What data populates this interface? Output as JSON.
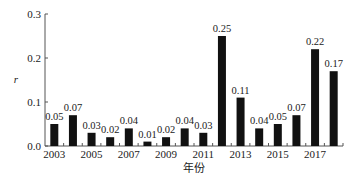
{
  "chart_data": {
    "type": "bar",
    "title": "",
    "xlabel": "年份",
    "ylabel": "r",
    "ylim": [
      0,
      0.3
    ],
    "yticks": [
      "0.0",
      "0.1",
      "0.2",
      "0.3"
    ],
    "xtick_labels": [
      "2003",
      "2005",
      "2007",
      "2009",
      "2011",
      "2013",
      "2015",
      "2017"
    ],
    "grid": false,
    "legend": null,
    "categories": [
      "2003",
      "2004",
      "2005",
      "2006",
      "2007",
      "2008",
      "2009",
      "2010",
      "2011",
      "2012",
      "2013",
      "2014",
      "2015",
      "2016",
      "2017",
      "2018"
    ],
    "values": [
      0.05,
      0.07,
      0.03,
      0.02,
      0.04,
      0.01,
      0.02,
      0.04,
      0.03,
      0.25,
      0.11,
      0.04,
      0.05,
      0.07,
      0.22,
      0.17
    ],
    "value_labels": [
      "0.05",
      "0.07",
      "0.03",
      "0.02",
      "0.04",
      "0.01",
      "0.02",
      "0.04",
      "0.03",
      "0.25",
      "0.11",
      "0.04",
      "0.05",
      "0.07",
      "0.22",
      "0.17"
    ],
    "bar_color": "#111111"
  }
}
